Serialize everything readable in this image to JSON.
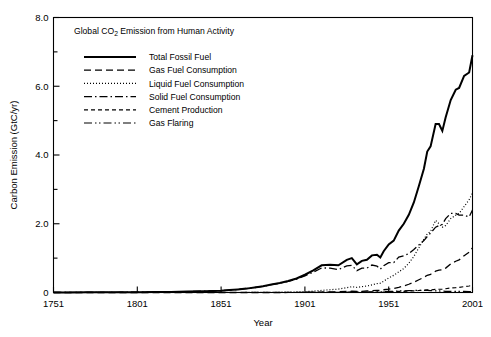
{
  "chart_data": {
    "type": "line",
    "title": "Global CO2 Emission from Human Activity",
    "title_parts": {
      "before": "Global CO",
      "subscript": "2",
      "after": " Emission from Human Activity"
    },
    "xlabel": "Year",
    "ylabel": "Carbon Emission (GtC/yr)",
    "xlim": [
      1751,
      2001
    ],
    "ylim": [
      0,
      8.0
    ],
    "grid": false,
    "legend_position": "upper-left-inside",
    "xticks": [
      1751,
      1801,
      1851,
      1901,
      1951,
      2001
    ],
    "xtick_labels": [
      "1751",
      "1801",
      "1851",
      "1901",
      "1951",
      "2001"
    ],
    "yticks": [
      0,
      2.0,
      4.0,
      6.0,
      8.0
    ],
    "ytick_labels": [
      "0",
      "2.0",
      "4.0",
      "6.0",
      "8.0"
    ],
    "yticks_minor": [
      1.0,
      3.0,
      5.0,
      7.0
    ],
    "x": [
      1751,
      1761,
      1771,
      1781,
      1791,
      1801,
      1811,
      1821,
      1831,
      1841,
      1851,
      1856,
      1861,
      1866,
      1871,
      1876,
      1881,
      1886,
      1891,
      1896,
      1901,
      1906,
      1911,
      1916,
      1921,
      1926,
      1929,
      1932,
      1935,
      1938,
      1941,
      1944,
      1946,
      1948,
      1951,
      1954,
      1957,
      1960,
      1963,
      1966,
      1969,
      1972,
      1974,
      1976,
      1979,
      1981,
      1983,
      1985,
      1988,
      1991,
      1993,
      1996,
      1999,
      2001
    ],
    "series": [
      {
        "name": "Total Fossil Fuel",
        "style": "solid",
        "stroke_width": 2.0,
        "values": [
          0.003,
          0.003,
          0.004,
          0.005,
          0.007,
          0.008,
          0.011,
          0.016,
          0.026,
          0.04,
          0.054,
          0.07,
          0.09,
          0.113,
          0.147,
          0.183,
          0.231,
          0.277,
          0.337,
          0.408,
          0.516,
          0.641,
          0.79,
          0.81,
          0.79,
          0.95,
          1.0,
          0.82,
          0.92,
          0.95,
          1.08,
          1.1,
          1.02,
          1.2,
          1.4,
          1.51,
          1.8,
          2.0,
          2.26,
          2.62,
          3.1,
          3.6,
          4.1,
          4.25,
          4.9,
          4.9,
          4.7,
          5.1,
          5.6,
          5.9,
          5.95,
          6.3,
          6.4,
          6.9
        ]
      },
      {
        "name": "Gas Fuel Consumption",
        "style": "long-dash",
        "stroke_width": 1.3,
        "values": [
          0,
          0,
          0,
          0,
          0,
          0,
          0,
          0,
          0,
          0,
          0,
          0,
          0,
          0,
          0,
          0,
          0,
          0,
          0.001,
          0.002,
          0.005,
          0.008,
          0.013,
          0.018,
          0.021,
          0.031,
          0.037,
          0.03,
          0.035,
          0.043,
          0.051,
          0.06,
          0.065,
          0.08,
          0.097,
          0.12,
          0.15,
          0.19,
          0.24,
          0.3,
          0.37,
          0.44,
          0.5,
          0.53,
          0.62,
          0.65,
          0.66,
          0.71,
          0.83,
          0.91,
          0.95,
          1.07,
          1.17,
          1.3
        ]
      },
      {
        "name": "Liquid Fuel Consumption",
        "style": "dotted",
        "stroke_width": 1.2,
        "values": [
          0,
          0,
          0,
          0,
          0,
          0,
          0,
          0,
          0,
          0,
          0,
          0,
          0,
          0.001,
          0.002,
          0.003,
          0.005,
          0.008,
          0.012,
          0.017,
          0.026,
          0.04,
          0.062,
          0.08,
          0.1,
          0.14,
          0.17,
          0.15,
          0.17,
          0.19,
          0.22,
          0.26,
          0.27,
          0.33,
          0.42,
          0.5,
          0.6,
          0.7,
          0.85,
          1.05,
          1.3,
          1.55,
          1.7,
          1.78,
          2.1,
          2.0,
          1.9,
          1.95,
          2.15,
          2.25,
          2.3,
          2.5,
          2.7,
          2.9
        ]
      },
      {
        "name": "Solid Fuel Consumption",
        "style": "dash-dot",
        "stroke_width": 1.3,
        "values": [
          0.003,
          0.003,
          0.004,
          0.005,
          0.007,
          0.008,
          0.011,
          0.016,
          0.026,
          0.04,
          0.054,
          0.07,
          0.09,
          0.112,
          0.145,
          0.18,
          0.226,
          0.269,
          0.324,
          0.389,
          0.485,
          0.593,
          0.715,
          0.71,
          0.665,
          0.775,
          0.79,
          0.635,
          0.71,
          0.71,
          0.8,
          0.77,
          0.68,
          0.78,
          0.87,
          0.87,
          1.03,
          1.07,
          1.13,
          1.25,
          1.38,
          1.51,
          1.63,
          1.73,
          1.9,
          1.95,
          1.98,
          2.15,
          2.3,
          2.3,
          2.25,
          2.25,
          2.2,
          2.4
        ]
      },
      {
        "name": "Cement Production",
        "style": "dash",
        "stroke_width": 1.2,
        "values": [
          0,
          0,
          0,
          0,
          0,
          0,
          0,
          0,
          0,
          0,
          0,
          0,
          0,
          0,
          0,
          0,
          0,
          0,
          0,
          0,
          0.001,
          0.002,
          0.003,
          0.003,
          0.004,
          0.007,
          0.009,
          0.006,
          0.008,
          0.011,
          0.01,
          0.008,
          0.009,
          0.014,
          0.019,
          0.024,
          0.03,
          0.035,
          0.042,
          0.05,
          0.058,
          0.07,
          0.075,
          0.077,
          0.09,
          0.095,
          0.1,
          0.11,
          0.13,
          0.14,
          0.15,
          0.17,
          0.19,
          0.21
        ]
      },
      {
        "name": "Gas Flaring",
        "style": "dash-dot-dot",
        "stroke_width": 1.2,
        "values": [
          0,
          0,
          0,
          0,
          0,
          0,
          0,
          0,
          0,
          0,
          0,
          0,
          0,
          0,
          0,
          0,
          0,
          0,
          0,
          0,
          0.001,
          0.002,
          0.003,
          0.004,
          0.005,
          0.008,
          0.011,
          0.009,
          0.011,
          0.014,
          0.016,
          0.018,
          0.019,
          0.024,
          0.03,
          0.036,
          0.045,
          0.05,
          0.056,
          0.06,
          0.062,
          0.062,
          0.06,
          0.055,
          0.05,
          0.045,
          0.04,
          0.035,
          0.035,
          0.033,
          0.032,
          0.03,
          0.028,
          0.027
        ]
      }
    ]
  },
  "legend": {
    "items": [
      {
        "label": "Total Fossil Fuel",
        "style": "solid"
      },
      {
        "label": "Gas Fuel Consumption",
        "style": "long-dash"
      },
      {
        "label": "Liquid Fuel Consumption",
        "style": "dotted"
      },
      {
        "label": "Solid Fuel Consumption",
        "style": "dash-dot"
      },
      {
        "label": "Cement Production",
        "style": "dash"
      },
      {
        "label": "Gas Flaring",
        "style": "dash-dot-dot"
      }
    ]
  },
  "colors": {
    "background": "#ffffff",
    "foreground": "#000000"
  }
}
